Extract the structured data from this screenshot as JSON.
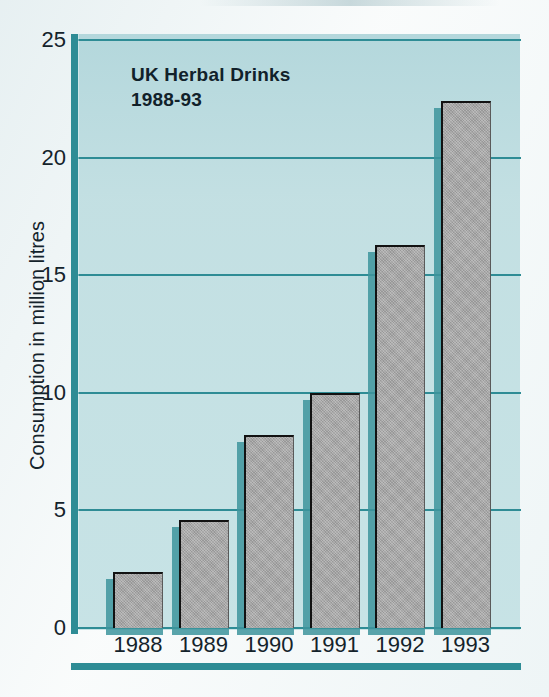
{
  "chart_data": {
    "type": "bar",
    "title": "UK Herbal Drinks",
    "subtitle": "1988-93",
    "categories": [
      "1988",
      "1989",
      "1990",
      "1991",
      "1992",
      "1993"
    ],
    "values": [
      2.4,
      4.6,
      8.2,
      10.0,
      16.3,
      22.4
    ],
    "xlabel": "",
    "ylabel": "Consumption in million litres",
    "ylim": [
      0,
      25
    ],
    "ytick_labels": [
      "0",
      "5",
      "10",
      "15",
      "20",
      "25"
    ],
    "ytick_values": [
      0,
      5,
      10,
      15,
      20,
      25
    ],
    "grid": "horizontal",
    "legend": "none",
    "units": "million litres",
    "colors": {
      "panel_background": "#bfdfe2",
      "bar_fill": "#a6a6a6",
      "bar_outline": "#121212",
      "axis_teal": "#2e8c95",
      "bar_shadow": "#3d949c",
      "text": "#14232b"
    }
  },
  "axis": {
    "y_title": "Consumption in million litres",
    "ticks": [
      {
        "label": "25",
        "value": 25
      },
      {
        "label": "20",
        "value": 20
      },
      {
        "label": "15",
        "value": 15
      },
      {
        "label": "10",
        "value": 10
      },
      {
        "label": "5",
        "value": 5
      },
      {
        "label": "0",
        "value": 0
      }
    ]
  },
  "title_block": {
    "line1": "UK Herbal Drinks",
    "line2": "1988-93"
  }
}
